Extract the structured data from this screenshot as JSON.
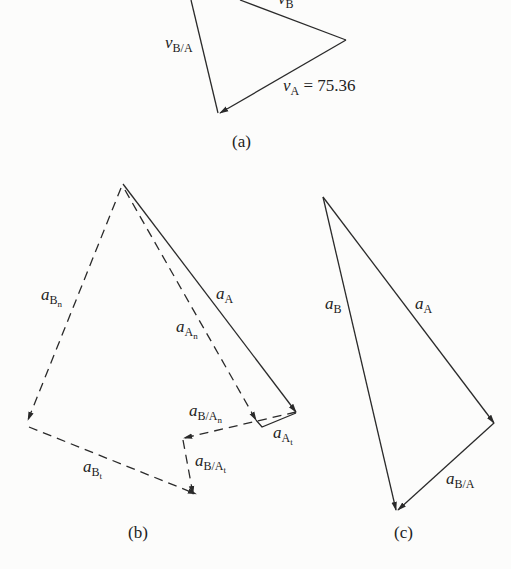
{
  "figure": {
    "panels": [
      {
        "id": "a",
        "caption": "(a)",
        "labels": {
          "v_B": {
            "sym": "v",
            "sub": "B"
          },
          "v_BA": {
            "sym": "v",
            "sub": "B/A"
          },
          "v_A": {
            "sym": "v",
            "sub": "A",
            "value_text": " = 75.36"
          }
        }
      },
      {
        "id": "b",
        "caption": "(b)",
        "labels": {
          "a_Bn": {
            "sym": "a",
            "sub": "B",
            "subsub": "n"
          },
          "a_A": {
            "sym": "a",
            "sub": "A"
          },
          "a_An": {
            "sym": "a",
            "sub": "A",
            "subsub": "n"
          },
          "a_BAn": {
            "sym": "a",
            "sub": "B/A",
            "subsub": "n"
          },
          "a_At": {
            "sym": "a",
            "sub": "A",
            "subsub": "t"
          },
          "a_BAt": {
            "sym": "a",
            "sub": "B/A",
            "subsub": "t"
          },
          "a_Bt": {
            "sym": "a",
            "sub": "B",
            "subsub": "t"
          }
        }
      },
      {
        "id": "c",
        "caption": "(c)",
        "labels": {
          "a_B": {
            "sym": "a",
            "sub": "B"
          },
          "a_A": {
            "sym": "a",
            "sub": "A"
          },
          "a_BA": {
            "sym": "a",
            "sub": "B/A"
          }
        }
      }
    ],
    "line_color": "#2a2a2a"
  }
}
